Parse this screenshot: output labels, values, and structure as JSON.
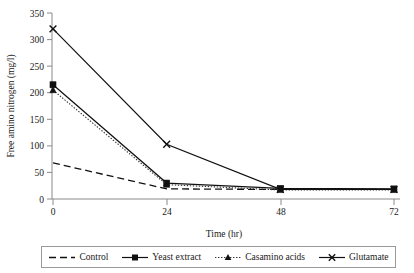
{
  "chart_data": {
    "type": "line",
    "title": "",
    "xlabel": "Time (hr)",
    "ylabel": "Free amino nitrogen (mg/l)",
    "x": [
      0,
      24,
      48,
      72
    ],
    "xticklabels": [
      "0",
      "24",
      "48",
      "72"
    ],
    "yticklabels": [
      "0",
      "50",
      "100",
      "150",
      "200",
      "250",
      "300",
      "350"
    ],
    "yticks": [
      0,
      50,
      100,
      150,
      200,
      250,
      300,
      350
    ],
    "xlim": [
      0,
      72
    ],
    "ylim": [
      0,
      350
    ],
    "grid": false,
    "legend_position": "below-bottom-center",
    "series": [
      {
        "name": "Control",
        "values": [
          68,
          19,
          18,
          18
        ],
        "style": "dashed",
        "marker": "none",
        "color": "#111111"
      },
      {
        "name": "Yeast extract",
        "values": [
          215,
          30,
          20,
          19
        ],
        "style": "solid",
        "marker": "square",
        "color": "#111111"
      },
      {
        "name": "Casamino acids",
        "values": [
          205,
          27,
          17,
          17
        ],
        "style": "dotted",
        "marker": "triangle",
        "color": "#333333"
      },
      {
        "name": "Glutamate",
        "values": [
          320,
          103,
          18,
          18
        ],
        "style": "solid",
        "marker": "cross",
        "color": "#111111"
      }
    ]
  },
  "axes": {
    "y_title": "Free amino nitrogen (mg/l)",
    "x_title": "Time (hr)",
    "y_ticks": [
      "350",
      "300",
      "250",
      "200",
      "150",
      "100",
      "50",
      "0"
    ],
    "x_ticks": [
      "0",
      "24",
      "48",
      "72"
    ]
  },
  "legend": {
    "items": [
      {
        "label": "Control",
        "marker": "none",
        "style": "dashed"
      },
      {
        "label": "Yeast extract",
        "marker": "square",
        "style": "solid"
      },
      {
        "label": "Casamino acids",
        "marker": "triangle",
        "style": "dotted"
      },
      {
        "label": "Glutamate",
        "marker": "cross",
        "style": "solid"
      }
    ]
  },
  "colors": {
    "ink": "#111111",
    "axis": "#8a8a8a",
    "legend_border": "#9a9a9a",
    "background": "#ffffff"
  }
}
